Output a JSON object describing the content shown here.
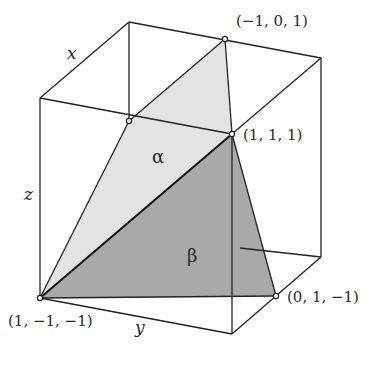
{
  "figure": {
    "colors": {
      "edge": "#222222",
      "alpha_fill": "#e3e3e3",
      "beta_fill": "#a9a9a9",
      "vertex_marker": "#ffffff",
      "background": "#ffffff"
    },
    "axes": {
      "x": "x",
      "y": "y",
      "z": "z"
    },
    "planes": {
      "alpha": "α",
      "beta": "β"
    },
    "points": [
      {
        "id": "p1",
        "label": "(−1, 0, 1)"
      },
      {
        "id": "p2",
        "label": "(1, 1, 1)"
      },
      {
        "id": "p3",
        "label": "(1, −1, −1)"
      },
      {
        "id": "p4",
        "label": "(0, 1, −1)"
      }
    ]
  }
}
